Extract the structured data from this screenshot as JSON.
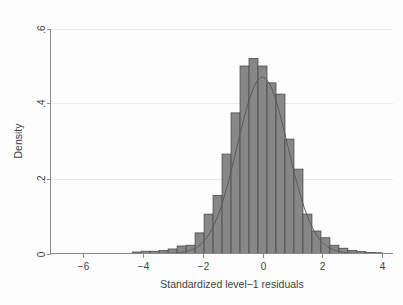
{
  "chart_data": {
    "type": "bar",
    "title": "",
    "subtitle": "",
    "xlabel": "Standardized level−1 residuals",
    "ylabel": "Density",
    "xlim": [
      -6.75,
      4.0
    ],
    "ylim": [
      0,
      0.6
    ],
    "xticks": [
      -6,
      -4,
      -2,
      0,
      2,
      4
    ],
    "xticklabels": [
      "−6",
      "−4",
      "−2",
      "0",
      "2",
      "4"
    ],
    "yticks": [
      0,
      0.2,
      0.4,
      0.6
    ],
    "yticklabels": [
      "0",
      ".2",
      ".4",
      ".6"
    ],
    "grid": "horizontal-faint",
    "legend": "none",
    "bin_width": 0.3,
    "bar_fill_color": "#878787",
    "bar_edge_color": "#4a4a4a",
    "curve_color": "#5a5a5a",
    "annotations": [],
    "bins": [
      {
        "x0": -6.75,
        "x1": -6.45,
        "density": 0.0
      },
      {
        "x0": -6.45,
        "x1": -6.15,
        "density": 0.0
      },
      {
        "x0": -6.15,
        "x1": -5.85,
        "density": 0.0
      },
      {
        "x0": -5.85,
        "x1": -5.55,
        "density": 0.0
      },
      {
        "x0": -5.55,
        "x1": -5.25,
        "density": 0.0
      },
      {
        "x0": -5.25,
        "x1": -4.95,
        "density": 0.0
      },
      {
        "x0": -4.95,
        "x1": -4.65,
        "density": 0.0
      },
      {
        "x0": -4.65,
        "x1": -4.35,
        "density": 0.0
      },
      {
        "x0": -4.35,
        "x1": -4.05,
        "density": 0.004
      },
      {
        "x0": -4.05,
        "x1": -3.75,
        "density": 0.006
      },
      {
        "x0": -3.75,
        "x1": -3.45,
        "density": 0.006
      },
      {
        "x0": -3.45,
        "x1": -3.15,
        "density": 0.008
      },
      {
        "x0": -3.15,
        "x1": -2.85,
        "density": 0.012
      },
      {
        "x0": -2.85,
        "x1": -2.55,
        "density": 0.02
      },
      {
        "x0": -2.55,
        "x1": -2.25,
        "density": 0.022
      },
      {
        "x0": -2.25,
        "x1": -1.95,
        "density": 0.055
      },
      {
        "x0": -1.95,
        "x1": -1.65,
        "density": 0.105
      },
      {
        "x0": -1.65,
        "x1": -1.35,
        "density": 0.155
      },
      {
        "x0": -1.35,
        "x1": -1.05,
        "density": 0.265
      },
      {
        "x0": -1.05,
        "x1": -0.75,
        "density": 0.375
      },
      {
        "x0": -0.75,
        "x1": -0.45,
        "density": 0.5
      },
      {
        "x0": -0.45,
        "x1": -0.15,
        "density": 0.52
      },
      {
        "x0": -0.15,
        "x1": 0.15,
        "density": 0.5
      },
      {
        "x0": 0.15,
        "x1": 0.45,
        "density": 0.455
      },
      {
        "x0": 0.45,
        "x1": 0.75,
        "density": 0.425
      },
      {
        "x0": 0.75,
        "x1": 1.05,
        "density": 0.305
      },
      {
        "x0": 1.05,
        "x1": 1.35,
        "density": 0.225
      },
      {
        "x0": 1.35,
        "x1": 1.65,
        "density": 0.105
      },
      {
        "x0": 1.65,
        "x1": 1.95,
        "density": 0.06
      },
      {
        "x0": 1.95,
        "x1": 2.25,
        "density": 0.042
      },
      {
        "x0": 2.25,
        "x1": 2.55,
        "density": 0.022
      },
      {
        "x0": 2.55,
        "x1": 2.85,
        "density": 0.014
      },
      {
        "x0": 2.85,
        "x1": 3.15,
        "density": 0.008
      },
      {
        "x0": 3.15,
        "x1": 3.45,
        "density": 0.005
      },
      {
        "x0": 3.45,
        "x1": 3.75,
        "density": 0.003
      },
      {
        "x0": 3.75,
        "x1": 4.0,
        "density": 0.002
      }
    ],
    "normal_curve": {
      "name": "normal density overlay",
      "mean": 0.0,
      "sd": 0.85,
      "peak_density": 0.47
    }
  }
}
